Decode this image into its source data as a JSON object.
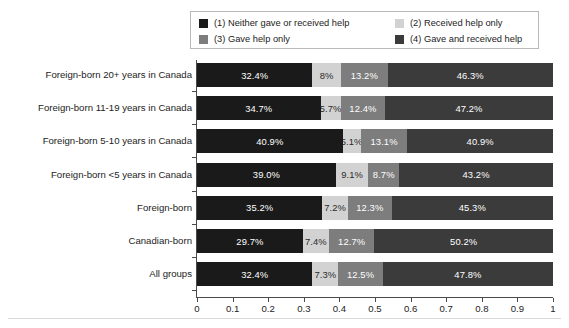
{
  "legend": {
    "items": [
      {
        "label": "(1) Neither gave or received help",
        "color": "#1a1a1a",
        "key": "neither"
      },
      {
        "label": "(2) Received help only",
        "color": "#d2d2d2",
        "key": "received"
      },
      {
        "label": "(3) Gave help only",
        "color": "#7d7d7d",
        "key": "gave"
      },
      {
        "label": "(4) Gave and received help",
        "color": "#3b3b3b",
        "key": "both"
      }
    ]
  },
  "chart_data": {
    "type": "bar",
    "orientation": "horizontal",
    "stacked": true,
    "normalized": true,
    "title": "",
    "xlabel": "",
    "ylabel": "",
    "xlim": [
      0,
      1
    ],
    "xticks": [
      "0",
      "0.1",
      "0.2",
      "0.3",
      "0.4",
      "0.5",
      "0.6",
      "0.7",
      "0.8",
      "0.9",
      "1"
    ],
    "xtick_values": [
      0,
      0.1,
      0.2,
      0.3,
      0.4,
      0.5,
      0.6,
      0.7,
      0.8,
      0.9,
      1
    ],
    "grid": false,
    "legend_position": "top",
    "categories": [
      "Foreign-born 20+ years in Canada",
      "Foreign-born 11-19 years in Canada",
      "Foreign-born 5-10 years in Canada",
      "Foreign-born <5 years in Canada",
      "Foreign-born",
      "Canadian-born",
      "All groups"
    ],
    "series": [
      {
        "name": "(1) Neither gave or received help",
        "color": "#1a1a1a",
        "values": [
          32.4,
          34.7,
          40.9,
          39.0,
          35.2,
          29.7,
          32.4
        ],
        "labels": [
          "32.4%",
          "34.7%",
          "40.9%",
          "39.0%",
          "35.2%",
          "29.7%",
          "32.4%"
        ]
      },
      {
        "name": "(2) Received help only",
        "color": "#d2d2d2",
        "values": [
          8.0,
          5.7,
          5.1,
          9.1,
          7.2,
          7.4,
          7.3
        ],
        "labels": [
          "8%",
          "5.7%",
          "5.1%",
          "9.1%",
          "7.2%",
          "7.4%",
          "7.3%"
        ]
      },
      {
        "name": "(3) Gave help only",
        "color": "#7d7d7d",
        "values": [
          13.2,
          12.4,
          13.1,
          8.7,
          12.3,
          12.7,
          12.5
        ],
        "labels": [
          "13.2%",
          "12.4%",
          "13.1%",
          "8.7%",
          "12.3%",
          "12.7%",
          "12.5%"
        ]
      },
      {
        "name": "(4) Gave and received help",
        "color": "#3b3b3b",
        "values": [
          46.3,
          47.2,
          40.9,
          43.2,
          45.3,
          50.2,
          47.8
        ],
        "labels": [
          "46.3%",
          "47.2%",
          "40.9%",
          "43.2%",
          "45.3%",
          "50.2%",
          "47.8%"
        ]
      }
    ]
  }
}
